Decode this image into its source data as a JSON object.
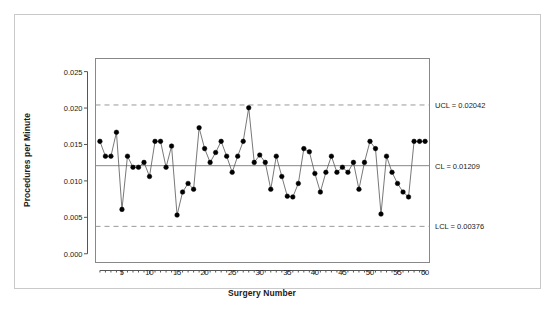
{
  "chart_data": {
    "type": "line",
    "title": "",
    "xlabel": "Surgery Number",
    "ylabel": "Procedures per Minute",
    "xlim": [
      0.2,
      60.8
    ],
    "ylim": [
      -0.0012,
      0.0268
    ],
    "grid": false,
    "legend": "none",
    "marker": "filled-circle",
    "x": [
      1,
      2,
      3,
      4,
      5,
      6,
      7,
      8,
      9,
      10,
      11,
      12,
      13,
      14,
      15,
      16,
      17,
      18,
      19,
      20,
      21,
      22,
      23,
      24,
      25,
      26,
      27,
      28,
      29,
      30,
      31,
      32,
      33,
      34,
      35,
      36,
      37,
      38,
      39,
      40,
      41,
      42,
      43,
      44,
      45,
      46,
      47,
      48,
      49,
      50,
      51,
      52,
      53,
      54,
      55,
      56,
      57,
      58,
      59,
      60
    ],
    "values": [
      0.01543,
      0.01339,
      0.01339,
      0.01667,
      0.00609,
      0.01339,
      0.01187,
      0.01187,
      0.01254,
      0.01061,
      0.01543,
      0.01543,
      0.01187,
      0.01478,
      0.00531,
      0.00847,
      0.00965,
      0.00885,
      0.0173,
      0.01443,
      0.01254,
      0.0139,
      0.01543,
      0.01339,
      0.01118,
      0.01339,
      0.01543,
      0.02004,
      0.01254,
      0.01355,
      0.01254,
      0.00885,
      0.01339,
      0.01061,
      0.0079,
      0.0078,
      0.00965,
      0.01443,
      0.014,
      0.01102,
      0.00847,
      0.01118,
      0.01339,
      0.01118,
      0.01187,
      0.01118,
      0.01254,
      0.00885,
      0.01254,
      0.01543,
      0.01443,
      0.00545,
      0.01339,
      0.01118,
      0.00965,
      0.00847,
      0.0078,
      0.01543,
      0.01543,
      0.01543
    ],
    "xticks": [
      5,
      10,
      15,
      20,
      25,
      30,
      35,
      40,
      45,
      50,
      55,
      60
    ],
    "xtick_labels": [
      "5",
      "10",
      "15",
      "20",
      "25",
      "30",
      "35",
      "40",
      "45",
      "50",
      "55",
      "60"
    ],
    "yticks": [
      0.0,
      0.005,
      0.01,
      0.015,
      0.02,
      0.025
    ],
    "ytick_labels": [
      "0.000",
      "0.005",
      "0.010",
      "0.015",
      "0.020",
      "0.025"
    ],
    "reference_lines": [
      {
        "name": "UCL",
        "label": "UCL = 0.02042",
        "value": 0.02042,
        "style": "dashed",
        "color": "#999999"
      },
      {
        "name": "CL",
        "label": "CL = 0.01209",
        "value": 0.01209,
        "style": "solid",
        "color": "#888888"
      },
      {
        "name": "LCL",
        "label": "LCL = 0.00376",
        "value": 0.00376,
        "style": "dashed",
        "color": "#999999"
      }
    ],
    "colors": {
      "marker": "#000000",
      "line": "#555555",
      "frame": "#888888",
      "border": "#c9c9c9",
      "text": "#1a1a1a"
    }
  }
}
